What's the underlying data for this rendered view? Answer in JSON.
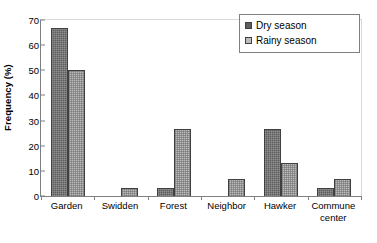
{
  "chart_data": {
    "type": "bar",
    "title": "",
    "xlabel": "",
    "ylabel": "Frequency (%)",
    "ylim": [
      0,
      70
    ],
    "ytick_step": 10,
    "yticks": [
      "70",
      "60",
      "50",
      "40",
      "30",
      "20",
      "10",
      "0"
    ],
    "grid": false,
    "legend_position": "top-right",
    "categories": [
      "Garden",
      "Swidden",
      "Forest",
      "Neighbor",
      "Hawker",
      "Commune center"
    ],
    "category_lines": [
      [
        "Garden",
        ""
      ],
      [
        "Swidden",
        ""
      ],
      [
        "Forest",
        ""
      ],
      [
        "Neighbor",
        ""
      ],
      [
        "Hawker",
        ""
      ],
      [
        "Commune",
        "center"
      ]
    ],
    "series": [
      {
        "name": "Dry season",
        "color": "#5e5e5e",
        "values": [
          66.7,
          0,
          3.3,
          0,
          26.7,
          3.3
        ]
      },
      {
        "name": "Rainy season",
        "color": "#bdbdbd",
        "values": [
          50.0,
          3.3,
          26.7,
          6.7,
          13.3,
          6.7
        ]
      }
    ]
  },
  "legend": {
    "entries": [
      {
        "label": "Dry season"
      },
      {
        "label": "Rainy season"
      }
    ]
  }
}
